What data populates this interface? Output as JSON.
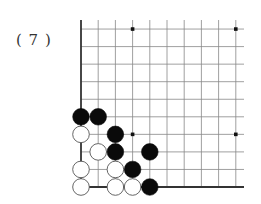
{
  "problem": {
    "label": "( 7 )"
  },
  "board": {
    "columns": 10,
    "rows": 10,
    "origin_x": 81,
    "origin_y": 187,
    "col_spacing": 17.2,
    "row_spacing": 17.55,
    "grid_right": 244,
    "grid_top_edge": 20,
    "line_color": "#888888",
    "edge_color": "#333333",
    "edges": [
      "left",
      "bottom"
    ],
    "star_points": [
      {
        "col": 3,
        "row": 3
      },
      {
        "col": 9,
        "row": 3
      },
      {
        "col": 3,
        "row": 9
      },
      {
        "col": 9,
        "row": 9
      }
    ],
    "stones": [
      {
        "color": "black",
        "col": 0,
        "row": 4
      },
      {
        "color": "black",
        "col": 1,
        "row": 4
      },
      {
        "color": "white",
        "col": 0,
        "row": 3
      },
      {
        "color": "black",
        "col": 2,
        "row": 3
      },
      {
        "color": "white",
        "col": 1,
        "row": 2
      },
      {
        "color": "black",
        "col": 2,
        "row": 2
      },
      {
        "color": "black",
        "col": 4,
        "row": 2
      },
      {
        "color": "white",
        "col": 0,
        "row": 1
      },
      {
        "color": "white",
        "col": 2,
        "row": 1
      },
      {
        "color": "black",
        "col": 3,
        "row": 1
      },
      {
        "color": "white",
        "col": 0,
        "row": 0
      },
      {
        "color": "white",
        "col": 2,
        "row": 0
      },
      {
        "color": "white",
        "col": 3,
        "row": 0
      },
      {
        "color": "black",
        "col": 4,
        "row": 0
      }
    ]
  }
}
